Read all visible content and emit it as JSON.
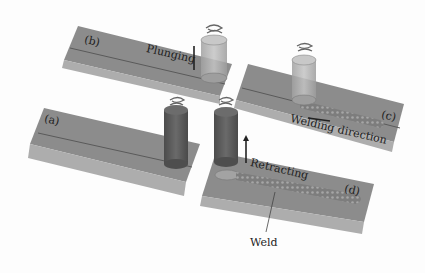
{
  "diagram": {
    "colors": {
      "background": "#fdfdfd",
      "plate_top": "#8f8f8f",
      "plate_side": "#a9a9a9",
      "tool_dark": "#5c5c5c",
      "tool_light": "#b4b4b4",
      "weld_bead": "#7a7a7a",
      "text": "#1e1e1e"
    },
    "panels": [
      {
        "id": "a",
        "label": "(a)",
        "stage": "tool rotating above plates"
      },
      {
        "id": "b",
        "label": "(b)",
        "stage": "plunging",
        "annotation": "Plunging"
      },
      {
        "id": "c",
        "label": "(c)",
        "stage": "welding",
        "annotation": "Welding direction"
      },
      {
        "id": "d",
        "label": "(d)",
        "stage": "retracting",
        "annotation": "Retracting"
      }
    ],
    "callouts": {
      "weld": "Weld"
    }
  }
}
